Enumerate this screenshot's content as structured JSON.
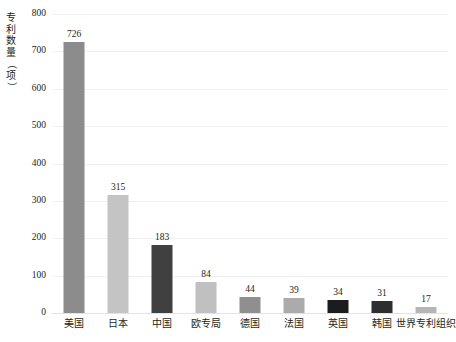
{
  "chart_data": {
    "type": "bar",
    "title": "",
    "xlabel": "",
    "ylabel": "专利数量（项）",
    "ylim": [
      0,
      800
    ],
    "grid": true,
    "legend": null,
    "categories": [
      "美国",
      "日本",
      "中国",
      "欧专局",
      "德国",
      "法国",
      "英国",
      "韩国",
      "世界专利组织"
    ],
    "values": [
      726,
      315,
      183,
      84,
      44,
      39,
      34,
      31,
      17
    ],
    "value_labels": [
      "726",
      "315",
      "183",
      "84",
      "44",
      "39",
      "34",
      "31",
      "17"
    ],
    "bar_colors": [
      "#8c8c8c",
      "#c4c4c4",
      "#404040",
      "#c0c0c0",
      "#8f8f8f",
      "#ababab",
      "#1c1c1c",
      "#2e2e2e",
      "#b5b5b5"
    ],
    "y_ticks": [
      800,
      700,
      600,
      500,
      400,
      300,
      200,
      100,
      0
    ],
    "y_tick_labels": [
      "800",
      "700",
      "600",
      "500",
      "400",
      "300",
      "200",
      "100",
      "0"
    ]
  },
  "axis": {
    "y_title_chars": [
      "专",
      "利",
      "数",
      "量",
      "（",
      "项",
      "）"
    ]
  },
  "colors": {
    "gridline": "#f0f0f0",
    "baseline": "#e3e3e3",
    "text": "#231f20",
    "background": "#ffffff"
  }
}
